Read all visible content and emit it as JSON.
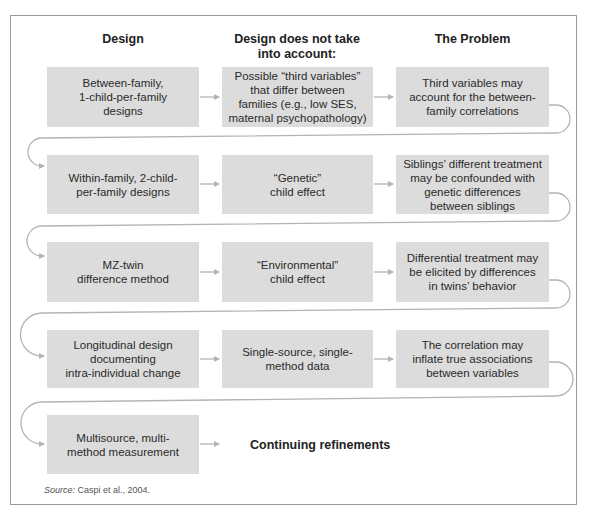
{
  "headers": {
    "design": "Design",
    "not_account": "Design does not take\ninto account:",
    "problem": "The Problem"
  },
  "rows": [
    {
      "design": "Between-family,\n1-child-per-family\ndesigns",
      "not_account": "Possible “third variables”\nthat differ between\nfamilies (e.g., low SES,\nmaternal psychopathology)",
      "problem": "Third variables may\naccount for the between-\nfamily correlations"
    },
    {
      "design": "Within-family, 2-child-\nper-family designs",
      "not_account": "“Genetic”\nchild effect",
      "problem": "Siblings’ different treatment\nmay be confounded with\ngenetic differences\nbetween siblings"
    },
    {
      "design": "MZ-twin\ndifference method",
      "not_account": "“Environmental”\nchild effect",
      "problem": "Differential treatment may\nbe elicited by differences\nin twins’ behavior"
    },
    {
      "design": "Longitudinal design\ndocumenting\nintra-individual change",
      "not_account": "Single-source, single-\nmethod data",
      "problem": "The correlation may\ninflate true associations\nbetween variables"
    },
    {
      "design": "Multisource, multi-\nmethod measurement",
      "continuation": "Continuing refinements"
    }
  ],
  "source": {
    "label": "Source:",
    "text": " Caspi et al., 2004."
  },
  "colors": {
    "box_fill": "#dcdcdc",
    "arrow": "#b4b4b4",
    "frame": "#9a9a9a"
  }
}
